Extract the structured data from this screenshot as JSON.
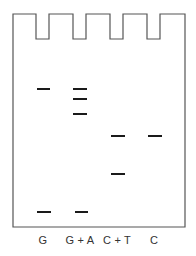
{
  "diagram": {
    "type": "sequencing-gel",
    "colors": {
      "outline": "#555555",
      "band": "#1a1a1a",
      "label": "#333333",
      "background": "#ffffff"
    },
    "gel": {
      "left": 13,
      "right": 185,
      "top": 14,
      "well_bottom": 39,
      "bottom": 227,
      "wells": [
        {
          "x1": 36,
          "x2": 49
        },
        {
          "x1": 73,
          "x2": 86
        },
        {
          "x1": 110,
          "x2": 123
        },
        {
          "x1": 147,
          "x2": 160
        }
      ]
    },
    "lanes": [
      {
        "label": "G",
        "center_x": 43,
        "bands": [
          {
            "x1": 37,
            "x2": 50,
            "y": 89
          },
          {
            "x1": 37,
            "x2": 51,
            "y": 212
          }
        ]
      },
      {
        "label": "G + A",
        "center_x": 80,
        "bands": [
          {
            "x1": 73,
            "x2": 87,
            "y": 89
          },
          {
            "x1": 73,
            "x2": 87,
            "y": 99
          },
          {
            "x1": 73,
            "x2": 87,
            "y": 114
          },
          {
            "x1": 75,
            "x2": 88,
            "y": 212
          }
        ]
      },
      {
        "label": "C + T",
        "center_x": 117,
        "bands": [
          {
            "x1": 111,
            "x2": 125,
            "y": 136
          },
          {
            "x1": 111,
            "x2": 125,
            "y": 174
          }
        ]
      },
      {
        "label": "C",
        "center_x": 154,
        "bands": [
          {
            "x1": 148,
            "x2": 162,
            "y": 136
          }
        ]
      }
    ]
  }
}
